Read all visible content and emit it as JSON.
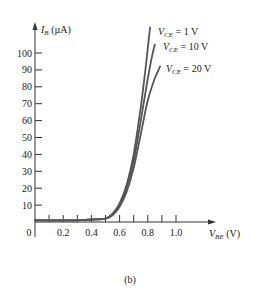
{
  "chart_data": {
    "type": "line",
    "title": "",
    "caption": "(b)",
    "xlabel": {
      "main": "V",
      "sub": "BE",
      "unit": "(V)"
    },
    "ylabel": {
      "main": "I",
      "sub": "B",
      "unit": "(µA)"
    },
    "xlim": [
      0,
      1.25
    ],
    "ylim": [
      0,
      115
    ],
    "x_ticks": [
      0,
      0.1,
      0.2,
      0.3,
      0.4,
      0.5,
      0.6,
      0.7,
      0.8,
      0.9,
      1.0
    ],
    "x_tick_labels": [
      {
        "value": 0,
        "label": "0"
      },
      {
        "value": 0.2,
        "label": "0.2"
      },
      {
        "value": 0.4,
        "label": "0.4"
      },
      {
        "value": 0.6,
        "label": "0.6"
      },
      {
        "value": 0.8,
        "label": "0.8"
      },
      {
        "value": 1.0,
        "label": "1.0"
      }
    ],
    "y_ticks": [
      10,
      20,
      30,
      40,
      50,
      60,
      70,
      80,
      90,
      100
    ],
    "y_tick_labels": [
      "10",
      "20",
      "30",
      "40",
      "50",
      "60",
      "70",
      "80",
      "90",
      "100"
    ],
    "grid": false,
    "legend": "inline labels at curve ends (top right)",
    "series": [
      {
        "name": "V_CE = 1 V",
        "label_main": "V",
        "label_sub": "CE",
        "label_rest": " = 1 V",
        "label_pos": [
          158,
          35
        ],
        "x": [
          0,
          0.1,
          0.2,
          0.3,
          0.4,
          0.5,
          0.55,
          0.6,
          0.65,
          0.7,
          0.75,
          0.78,
          0.8,
          0.816
        ],
        "y": [
          1,
          1,
          1,
          1,
          1.5,
          2,
          5,
          11,
          22,
          40,
          68,
          88,
          103,
          115
        ]
      },
      {
        "name": "V_CE = 10 V",
        "label_main": "V",
        "label_sub": "CE",
        "label_rest": " = 10 V",
        "label_pos": [
          163,
          50
        ],
        "x": [
          0,
          0.1,
          0.2,
          0.3,
          0.4,
          0.5,
          0.55,
          0.6,
          0.65,
          0.7,
          0.75,
          0.8,
          0.83,
          0.85
        ],
        "y": [
          1,
          1,
          1,
          1,
          1.5,
          2,
          4.5,
          10,
          20,
          36,
          60,
          85,
          98,
          105
        ]
      },
      {
        "name": "V_CE = 20 V",
        "label_main": "V",
        "label_sub": "CE",
        "label_rest": " = 20 V",
        "label_pos": [
          166,
          72
        ],
        "x": [
          0,
          0.1,
          0.2,
          0.3,
          0.4,
          0.5,
          0.55,
          0.6,
          0.65,
          0.7,
          0.75,
          0.8,
          0.85,
          0.887
        ],
        "y": [
          1,
          1,
          1,
          1,
          1.5,
          2,
          4,
          9,
          18,
          32,
          52,
          72,
          85,
          92
        ]
      }
    ],
    "colors": {
      "curve": "#555555",
      "axis": "#333333",
      "text": "#222222"
    }
  }
}
